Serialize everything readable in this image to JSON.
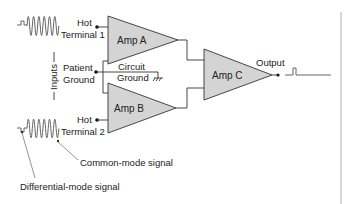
{
  "diagram": {
    "amplifiers": {
      "a": "Amp A",
      "b": "Amp B",
      "c": "Amp C"
    },
    "terminals": {
      "hot1_line1": "Hot",
      "hot1_line2": "Terminal 1",
      "hot2_line1": "Hot",
      "hot2_line2": "Terminal 2",
      "patient_line1": "Patient",
      "patient_line2": "Ground",
      "circuit_line1": "Circuit",
      "circuit_line2": "Ground"
    },
    "inputs_label": "Inputs",
    "output_label": "Output",
    "annotations": {
      "common_mode": "Common-mode signal",
      "differential_mode": "Differential-mode signal"
    },
    "colors": {
      "amp_fill": "#d4d4d4",
      "line": "#333333",
      "divider": "#999999"
    }
  }
}
